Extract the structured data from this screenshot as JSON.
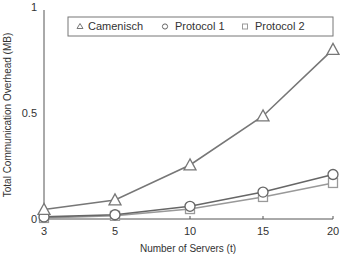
{
  "chart_data": {
    "type": "line",
    "title": "",
    "xlabel": "Number of Servers (t)",
    "ylabel": "Total Communication Overhead (MB)",
    "x": [
      3,
      5,
      10,
      15,
      20
    ],
    "x_tick_labels": [
      "3",
      "5",
      "10",
      "15",
      "20"
    ],
    "y_tick_labels": [
      "0",
      "0.5",
      "1"
    ],
    "y_ticks": [
      0,
      0.5,
      1
    ],
    "ylim": [
      0,
      1
    ],
    "grid": false,
    "legend_position": "top",
    "series": [
      {
        "name": "Camenisch",
        "marker": "triangle",
        "color": "#777777",
        "values": [
          0.045,
          0.09,
          0.255,
          0.486,
          0.8
        ]
      },
      {
        "name": "Protocol 1",
        "marker": "circle",
        "color": "#666666",
        "values": [
          0.01,
          0.02,
          0.06,
          0.127,
          0.21
        ]
      },
      {
        "name": "Protocol 2",
        "marker": "square",
        "color": "#999999",
        "values": [
          0.005,
          0.015,
          0.047,
          0.104,
          0.17
        ]
      }
    ]
  }
}
